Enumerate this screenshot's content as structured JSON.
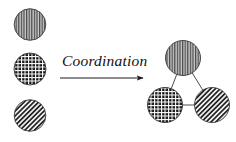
{
  "figure": {
    "type": "scientific-schematic",
    "background_color": "#ffffff",
    "width": 236,
    "height": 142,
    "stroke_color": "#1a1a1a",
    "caption_text": "Coordination"
  },
  "arrow": {
    "label": "Coordination",
    "direction": "left-to-right",
    "x1": 60,
    "y1": 78,
    "x2": 145,
    "y2": 78,
    "color": "#1a1a1a"
  },
  "reactants": {
    "group_label": "separate particles",
    "items": [
      {
        "id": "particle-vertical-stripe",
        "pattern": "vertical-stripes",
        "cx": 30,
        "cy": 24.5,
        "r": 15.8,
        "fill_color": "#9a9a9a",
        "line_color": "#2b2b2b"
      },
      {
        "id": "particle-crosshatch",
        "pattern": "crosshatch-grid",
        "cx": 30,
        "cy": 69,
        "r": 16,
        "fill_color": "#1c1c1c",
        "line_color": "#ffffff"
      },
      {
        "id": "particle-diagonal-stripe",
        "pattern": "diagonal-stripes",
        "cx": 30,
        "cy": 115.5,
        "r": 15.8,
        "fill_color": "#2b2b2b",
        "line_color": "#f2f2f2"
      }
    ]
  },
  "products": {
    "group_label": "coordinated assembly",
    "items": [
      {
        "id": "assembly-node-top",
        "pattern": "vertical-stripes",
        "cx": 183,
        "cy": 58,
        "r": 17.5,
        "fill_color": "#9a9a9a",
        "line_color": "#2b2b2b"
      },
      {
        "id": "assembly-node-bottom-left",
        "pattern": "crosshatch-grid",
        "cx": 165,
        "cy": 105,
        "r": 17.5,
        "fill_color": "#1c1c1c",
        "line_color": "#ffffff"
      },
      {
        "id": "assembly-node-bottom-right",
        "pattern": "diagonal-stripes",
        "cx": 212,
        "cy": 105,
        "r": 17.5,
        "fill_color": "#2b2b2b",
        "line_color": "#f2f2f2"
      }
    ],
    "bonds": [
      {
        "id": "bond-top-to-bottom-left",
        "from": "assembly-node-top",
        "to": "assembly-node-bottom-left"
      },
      {
        "id": "bond-top-to-bottom-right",
        "from": "assembly-node-top",
        "to": "assembly-node-bottom-right"
      },
      {
        "id": "bond-bottom-left-to-bottom-right",
        "from": "assembly-node-bottom-left",
        "to": "assembly-node-bottom-right"
      }
    ]
  }
}
